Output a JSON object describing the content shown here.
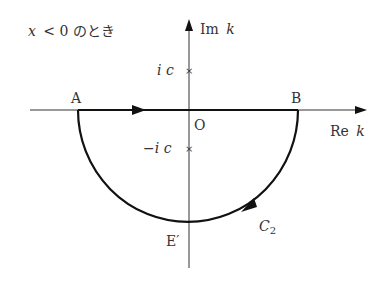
{
  "title": "x < 0 のとき",
  "title_parts": {
    "var": "x",
    "rest": "< 0 のとき"
  },
  "axes": {
    "imaginary_label": "Im",
    "imaginary_var": "k",
    "real_label": "Re",
    "real_var": "k",
    "origin": "O"
  },
  "points": {
    "A": "A",
    "B": "B",
    "E_prime": "E′"
  },
  "poles": {
    "upper": "i c",
    "lower": "−i c",
    "marker": "×"
  },
  "contour": {
    "name": "C",
    "subscript": "2"
  },
  "colors": {
    "line": "#111111",
    "text": "#333333"
  }
}
